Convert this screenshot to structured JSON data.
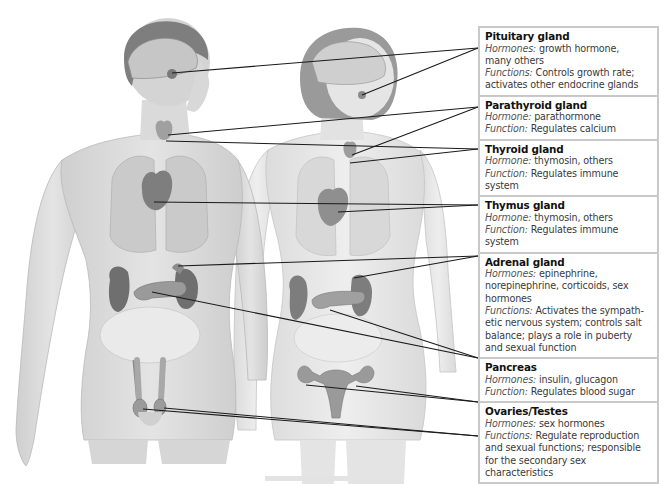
{
  "diagram": {
    "figures": [
      "male-figure",
      "female-figure"
    ]
  },
  "glands": [
    {
      "name": "Pituitary gland",
      "lines": [
        {
          "label": "Hormones:",
          "text": " growth hormone,"
        },
        {
          "label": "",
          "text": "many others"
        },
        {
          "label": "Functions:",
          "text": " Controls growth rate;"
        },
        {
          "label": "",
          "text": "activates other endocrine glands"
        }
      ]
    },
    {
      "name": "Parathyroid gland",
      "lines": [
        {
          "label": "Hormone:",
          "text": " parathormone"
        },
        {
          "label": "Function:",
          "text": " Regulates calcium"
        }
      ]
    },
    {
      "name": "Thyroid gland",
      "lines": [
        {
          "label": "Hormone:",
          "text": " thymosin, others"
        },
        {
          "label": "Function:",
          "text": " Regulates immune system"
        }
      ]
    },
    {
      "name": "Thymus gland",
      "lines": [
        {
          "label": "Hormone:",
          "text": " thymosin, others"
        },
        {
          "label": "Function:",
          "text": " Regulates immune system"
        }
      ]
    },
    {
      "name": "Adrenal gland",
      "lines": [
        {
          "label": "Hormones:",
          "text": " epinephrine,"
        },
        {
          "label": "",
          "text": "norepinephrine, corticoids, sex"
        },
        {
          "label": "",
          "text": "hormones"
        },
        {
          "label": "Functions:",
          "text": " Activates the sympath-"
        },
        {
          "label": "",
          "text": "etic nervous system; controls salt"
        },
        {
          "label": "",
          "text": "balance; plays a role in puberty"
        },
        {
          "label": "",
          "text": "and sexual function"
        }
      ]
    },
    {
      "name": "Pancreas",
      "lines": [
        {
          "label": "Hormones:",
          "text": " insulin, glucagon"
        },
        {
          "label": "Function:",
          "text": " Regulates blood sugar"
        }
      ]
    },
    {
      "name": "Ovaries/Testes",
      "lines": [
        {
          "label": "Hormones:",
          "text": " sex hormones"
        },
        {
          "label": "Functions:",
          "text": " Regulate reproduction"
        },
        {
          "label": "",
          "text": "and sexual functions; responsible"
        },
        {
          "label": "",
          "text": "for the secondary sex characteristics"
        }
      ]
    }
  ],
  "colors": {
    "box_border": "#c9c9c9",
    "leader_line": "#1a1a1a",
    "skin_male": "#d9d9d9",
    "skin_female": "#e6e6e6",
    "organ": "#8c8c8c"
  }
}
